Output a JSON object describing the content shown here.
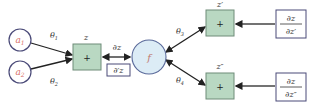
{
  "inputs": [
    {
      "id": "a1",
      "label": "a",
      "sub": "1"
    },
    {
      "id": "a2",
      "label": "a",
      "sub": "2"
    }
  ],
  "weights": {
    "theta1": {
      "label": "θ",
      "sub": "1"
    },
    "theta2": {
      "label": "θ",
      "sub": "2"
    },
    "theta3": {
      "label": "θ",
      "sub": "3"
    },
    "theta4": {
      "label": "θ",
      "sub": "4"
    }
  },
  "nodes": {
    "z": {
      "label": "z",
      "op": "+"
    },
    "f": {
      "label": "f"
    },
    "z_prime": {
      "label": "z′",
      "op": "+"
    },
    "z_dprime": {
      "label": "z″",
      "op": "+"
    }
  },
  "gradients": {
    "dz": "∂z",
    "d_prime_z": "∂′z",
    "dz_dzprime": {
      "num": "∂z",
      "den": "∂z′"
    },
    "dz_dzdprime": {
      "num": "∂z",
      "den": "∂z″"
    }
  },
  "colors": {
    "input_text": "#d9706a",
    "circle_stroke": "#4a4a78",
    "box_fill": "#b9d8c2",
    "box_stroke": "#6e8c78",
    "f_fill": "#dcecf6",
    "f_stroke": "#5a6a9a",
    "deriv_box_stroke": "#4a4a78"
  }
}
